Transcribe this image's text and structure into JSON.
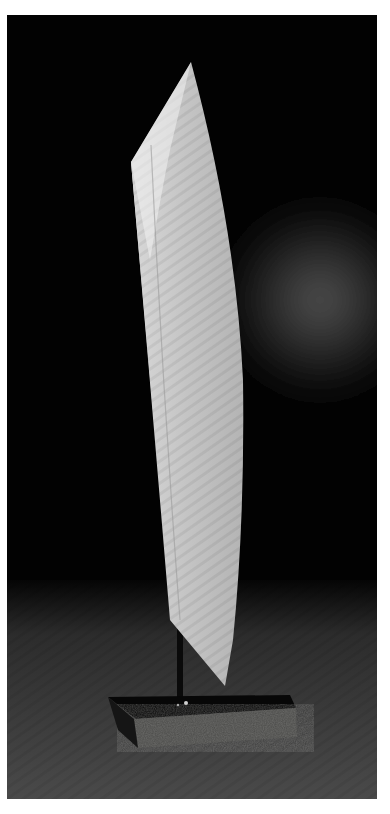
{
  "image": {
    "subject": "White abstract blade-shaped sculpture on a rough stone base",
    "alt": "Tall white curved blade sculpture mounted on a thin black rod atop a dark rough-hewn stone block, photographed against a black background with a soft grey light haze",
    "background_color": "#020202",
    "haze_color": "#5a5a5a",
    "sculpture_color": "#c8c8c8",
    "sculpture_highlight": "#ececec",
    "base_color": "#4a4a48",
    "floor_color": "#3a3a3a"
  }
}
